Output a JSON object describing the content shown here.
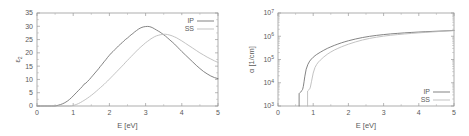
{
  "figure": {
    "title": "",
    "panels": [
      "left",
      "right"
    ]
  },
  "chart_data": [
    {
      "id": "left",
      "type": "line",
      "title": "",
      "xlabel": "E [eV]",
      "ylabel": "ε",
      "ylabel_sub": "2",
      "xlim": [
        0,
        5
      ],
      "ylim": [
        0,
        35
      ],
      "xticks": [
        0,
        1,
        2,
        3,
        4,
        5
      ],
      "xticklabels": [
        "0",
        "1",
        "2",
        "3",
        "4",
        "5"
      ],
      "yticks": [
        0,
        5,
        10,
        15,
        20,
        25,
        30,
        35
      ],
      "yticklabels": [
        "0",
        "5",
        "10",
        "15",
        "20",
        "25",
        "30",
        "35"
      ],
      "yscale": "linear",
      "xscale": "linear",
      "grid": false,
      "legend_position": "top-right",
      "legend": [
        "IP",
        "SS"
      ],
      "series": [
        {
          "name": "IP",
          "color": "#6e6e6e",
          "x": [
            0.0,
            0.1,
            0.2,
            0.3,
            0.4,
            0.5,
            0.55,
            0.6,
            0.65,
            0.7,
            0.75,
            0.8,
            0.85,
            0.9,
            0.95,
            1.0,
            1.05,
            1.1,
            1.15,
            1.2,
            1.25,
            1.3,
            1.35,
            1.4,
            1.45,
            1.5,
            1.55,
            1.6,
            1.65,
            1.7,
            1.75,
            1.8,
            1.85,
            1.9,
            1.95,
            2.0,
            2.05,
            2.1,
            2.15,
            2.2,
            2.25,
            2.3,
            2.35,
            2.4,
            2.45,
            2.5,
            2.55,
            2.6,
            2.65,
            2.7,
            2.75,
            2.8,
            2.85,
            2.9,
            2.95,
            3.0,
            3.05,
            3.1,
            3.15,
            3.2,
            3.25,
            3.3,
            3.35,
            3.4,
            3.45,
            3.5,
            3.55,
            3.6,
            3.65,
            3.7,
            3.75,
            3.8,
            3.85,
            3.9,
            3.95,
            4.0,
            4.1,
            4.2,
            4.3,
            4.4,
            4.5,
            4.6,
            4.7,
            4.8,
            4.9,
            5.0
          ],
          "y": [
            0.0,
            0.0,
            0.0,
            0.0,
            0.0,
            0.0,
            0.15,
            0.35,
            0.55,
            0.8,
            1.1,
            1.5,
            1.95,
            2.5,
            3.1,
            3.8,
            4.5,
            5.2,
            5.9,
            6.6,
            7.3,
            8.2,
            8.6,
            9.3,
            10.0,
            10.8,
            11.6,
            12.4,
            13.2,
            14.0,
            14.9,
            15.7,
            16.6,
            17.4,
            18.3,
            19.1,
            19.9,
            20.5,
            21.2,
            21.9,
            22.6,
            23.2,
            23.8,
            24.5,
            25.1,
            25.6,
            26.2,
            26.8,
            27.3,
            27.9,
            28.4,
            28.9,
            29.3,
            29.6,
            29.8,
            29.9,
            29.95,
            29.9,
            29.7,
            29.4,
            29.0,
            28.6,
            28.2,
            27.8,
            27.3,
            26.8,
            26.3,
            25.7,
            25.1,
            24.5,
            23.9,
            23.3,
            22.6,
            21.9,
            21.2,
            20.5,
            19.2,
            17.9,
            16.6,
            15.3,
            14.1,
            13.0,
            12.1,
            11.3,
            10.7,
            10.3
          ]
        },
        {
          "name": "SS",
          "color": "#b8b8b8",
          "x": [
            0.0,
            0.2,
            0.4,
            0.6,
            0.8,
            0.9,
            0.95,
            1.0,
            1.05,
            1.1,
            1.15,
            1.2,
            1.25,
            1.3,
            1.35,
            1.4,
            1.45,
            1.5,
            1.55,
            1.6,
            1.65,
            1.7,
            1.75,
            1.8,
            1.85,
            1.9,
            1.95,
            2.0,
            2.05,
            2.1,
            2.15,
            2.2,
            2.25,
            2.3,
            2.35,
            2.4,
            2.45,
            2.5,
            2.55,
            2.6,
            2.65,
            2.7,
            2.75,
            2.8,
            2.85,
            2.9,
            2.95,
            3.0,
            3.05,
            3.1,
            3.15,
            3.2,
            3.25,
            3.3,
            3.35,
            3.4,
            3.45,
            3.5,
            3.55,
            3.6,
            3.65,
            3.7,
            3.75,
            3.8,
            3.85,
            3.9,
            3.95,
            4.0,
            4.1,
            4.2,
            4.3,
            4.4,
            4.5,
            4.6,
            4.7,
            4.8,
            4.9,
            5.0
          ],
          "y": [
            0.0,
            0.0,
            0.0,
            0.0,
            0.0,
            0.0,
            0.05,
            0.2,
            0.4,
            0.65,
            0.95,
            1.3,
            1.7,
            2.1,
            2.55,
            3.0,
            3.5,
            4.0,
            4.55,
            5.1,
            5.7,
            6.3,
            6.9,
            7.5,
            8.1,
            8.8,
            9.4,
            10.1,
            10.8,
            11.5,
            12.2,
            12.9,
            13.6,
            14.3,
            15.0,
            15.7,
            16.5,
            17.2,
            17.9,
            18.6,
            19.3,
            20.0,
            20.7,
            21.4,
            22.0,
            22.6,
            23.2,
            23.8,
            24.3,
            24.8,
            25.3,
            25.7,
            26.1,
            26.4,
            26.6,
            26.8,
            26.9,
            27.0,
            27.0,
            26.9,
            26.75,
            26.55,
            26.3,
            26.0,
            25.7,
            25.3,
            24.9,
            24.5,
            23.6,
            22.7,
            21.8,
            20.9,
            20.0,
            19.2,
            18.4,
            17.7,
            17.0,
            16.4
          ]
        }
      ]
    },
    {
      "id": "right",
      "type": "line",
      "title": "",
      "xlabel": "E [eV]",
      "ylabel": "α [1/cm]",
      "xlim": [
        0,
        5
      ],
      "ylim": [
        1000,
        10000000
      ],
      "yscale": "log",
      "xscale": "linear",
      "xticks": [
        0,
        1,
        2,
        3,
        4,
        5
      ],
      "xticklabels": [
        "0",
        "1",
        "2",
        "3",
        "4",
        "5"
      ],
      "yticks": [
        1000,
        10000,
        100000,
        1000000,
        10000000
      ],
      "yticklabels": [
        "10",
        "10",
        "10",
        "10",
        "10"
      ],
      "yticksuperscripts": [
        "3",
        "4",
        "5",
        "6",
        "7"
      ],
      "grid": false,
      "legend_position": "bottom-right",
      "legend": [
        "IP",
        "SS"
      ],
      "series": [
        {
          "name": "IP",
          "color": "#6e6e6e",
          "x": [
            0.6,
            0.6,
            0.62,
            0.64,
            0.66,
            0.68,
            0.7,
            0.72,
            0.74,
            0.76,
            0.8,
            0.85,
            0.9,
            0.95,
            1.0,
            1.05,
            1.1,
            1.2,
            1.3,
            1.4,
            1.5,
            1.6,
            1.7,
            1.8,
            1.9,
            2.0,
            2.2,
            2.4,
            2.6,
            2.8,
            3.0,
            3.2,
            3.4,
            3.6,
            3.8,
            4.0,
            4.2,
            4.4,
            4.6,
            4.8,
            5.0
          ],
          "y": [
            1000,
            3400,
            3700,
            3900,
            4300,
            4600,
            5200,
            7000,
            11000,
            18000,
            38000,
            62000,
            85000,
            105000,
            125000,
            145000,
            165000,
            205000,
            250000,
            300000,
            350000,
            405000,
            460000,
            520000,
            580000,
            640000,
            760000,
            880000,
            990000,
            1090000,
            1180000,
            1260000,
            1330000,
            1400000,
            1460000,
            1520000,
            1570000,
            1620000,
            1670000,
            1720000,
            1770000
          ]
        },
        {
          "name": "SS",
          "color": "#b8b8b8",
          "x": [
            0.84,
            0.84,
            0.86,
            0.88,
            0.9,
            0.92,
            0.95,
            1.0,
            1.05,
            1.1,
            1.15,
            1.2,
            1.3,
            1.4,
            1.5,
            1.6,
            1.7,
            1.8,
            1.9,
            2.0,
            2.2,
            2.4,
            2.6,
            2.8,
            3.0,
            3.2,
            3.4,
            3.6,
            3.8,
            4.0,
            4.2,
            4.4,
            4.6,
            4.8,
            5.0
          ],
          "y": [
            1000,
            4400,
            4700,
            5000,
            5400,
            6500,
            11000,
            26000,
            45000,
            62000,
            78000,
            93000,
            128000,
            168000,
            210000,
            255000,
            300000,
            350000,
            400000,
            455000,
            570000,
            690000,
            805000,
            910000,
            1010000,
            1100000,
            1180000,
            1255000,
            1330000,
            1400000,
            1470000,
            1540000,
            1610000,
            1680000,
            1750000
          ]
        }
      ]
    }
  ]
}
